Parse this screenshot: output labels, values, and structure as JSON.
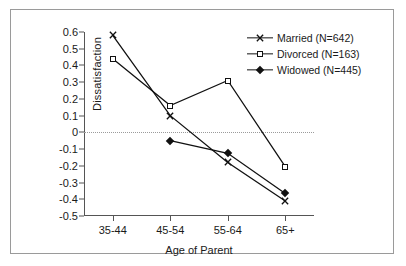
{
  "chart_data": {
    "type": "line",
    "title": "",
    "xlabel": "Age of Parent",
    "ylabel": "Dissatisfaction",
    "categories": [
      "35-44",
      "45-54",
      "55-64",
      "65+"
    ],
    "ylim": [
      -0.5,
      0.6
    ],
    "yticks": [
      "0.6",
      "0.5",
      "0.4",
      "0.3",
      "0.2",
      "0.1",
      "0",
      "-0.1",
      "-0.2",
      "-0.3",
      "-0.4",
      "-0.5"
    ],
    "ytick_values": [
      0.6,
      0.5,
      0.4,
      0.3,
      0.2,
      0.1,
      0,
      -0.1,
      -0.2,
      -0.3,
      -0.4,
      -0.5
    ],
    "grid": false,
    "zero_reference_line": true,
    "legend_position": "top-right",
    "series": [
      {
        "name": "Married (N=642)",
        "marker": "x-cross",
        "values": [
          0.58,
          0.1,
          -0.18,
          -0.41
        ]
      },
      {
        "name": "Divorced (N=163)",
        "marker": "open-square",
        "values": [
          0.44,
          0.16,
          0.31,
          -0.205
        ]
      },
      {
        "name": "Widowed  (N=445)",
        "marker": "filled-diamond",
        "values": [
          null,
          -0.05,
          -0.125,
          -0.365
        ]
      }
    ]
  },
  "colors": {
    "line": "#111111",
    "axis": "#555555",
    "zero_line": "#9b9b9b",
    "border": "#9a9a9a",
    "background": "#ffffff"
  }
}
